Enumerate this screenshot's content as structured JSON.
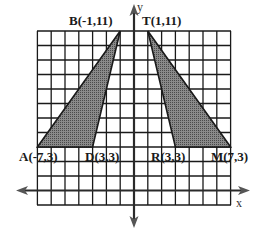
{
  "figure": {
    "type": "coordinate-plane",
    "axes": {
      "x_label": "x",
      "y_label": "y"
    },
    "grid": {
      "x_min": -7,
      "x_max": 7,
      "y_min": -1,
      "y_max": 11
    },
    "colors": {
      "grid": "#1a1a1a",
      "fill": "#6e6e6e",
      "axis": "#2a2a2a"
    }
  },
  "points": {
    "A": {
      "label": "A(-7,3)"
    },
    "B": {
      "label": "B(-1,11)"
    },
    "D": {
      "label": "D(3,3)"
    },
    "T": {
      "label": "T(1,11)"
    },
    "R": {
      "label": "R(3,3)"
    },
    "M": {
      "label": "M(7,3)"
    }
  },
  "shapes": [
    {
      "name": "triangle-ABD",
      "vertices": [
        "A",
        "B",
        "D"
      ]
    },
    {
      "name": "triangle-TRM",
      "vertices": [
        "T",
        "R",
        "M"
      ]
    }
  ]
}
